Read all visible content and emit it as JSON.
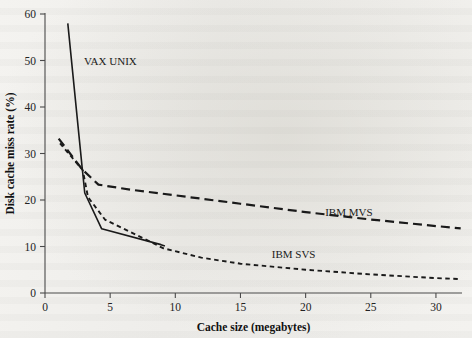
{
  "figure": {
    "background_color": "#f2f1ee",
    "ink_color": "#1a1a1a"
  },
  "chart_data": {
    "type": "line",
    "title": "",
    "subtitle": "",
    "xlabel": "Cache size (megabytes)",
    "ylabel": "Disk cache miss rate (%)",
    "xlim": [
      0,
      32
    ],
    "ylim": [
      0,
      60
    ],
    "xticks": [
      0,
      5,
      10,
      15,
      20,
      25,
      30
    ],
    "xtick_labels": [
      "0",
      "5",
      "10",
      "15",
      "20",
      "25",
      "30"
    ],
    "yticks": [
      0,
      10,
      20,
      30,
      40,
      50,
      60
    ],
    "ytick_labels": [
      "0",
      "10",
      "20",
      "30",
      "40",
      "50",
      "60"
    ],
    "grid": false,
    "legend_position": "inline-annotations",
    "series": [
      {
        "name": "VAX UNIX",
        "style": "solid",
        "label_x": 3.0,
        "label_y": 49.0,
        "points": [
          {
            "x": 1.75,
            "y": 58.0
          },
          {
            "x": 2.85,
            "y": 27.0
          },
          {
            "x": 3.05,
            "y": 21.5
          },
          {
            "x": 4.35,
            "y": 13.8
          },
          {
            "x": 8.9,
            "y": 10.4
          },
          {
            "x": 9.2,
            "y": 10.1
          }
        ]
      },
      {
        "name": "IBM MVS",
        "style": "long-dash",
        "label_x": 21.5,
        "label_y": 16.6,
        "points": [
          {
            "x": 1.05,
            "y": 33.2
          },
          {
            "x": 2.85,
            "y": 26.6
          },
          {
            "x": 4.1,
            "y": 23.3
          },
          {
            "x": 6.6,
            "y": 22.2
          },
          {
            "x": 10.0,
            "y": 21.0
          },
          {
            "x": 15.0,
            "y": 19.2
          },
          {
            "x": 20.0,
            "y": 17.4
          },
          {
            "x": 25.0,
            "y": 15.8
          },
          {
            "x": 30.0,
            "y": 14.4
          },
          {
            "x": 31.9,
            "y": 13.9
          }
        ]
      },
      {
        "name": "IBM SVS",
        "style": "short-dash",
        "label_x": 17.4,
        "label_y": 7.5,
        "points": [
          {
            "x": 1.15,
            "y": 32.2
          },
          {
            "x": 2.9,
            "y": 26.4
          },
          {
            "x": 3.3,
            "y": 20.6
          },
          {
            "x": 4.6,
            "y": 15.8
          },
          {
            "x": 9.1,
            "y": 9.6
          },
          {
            "x": 12.0,
            "y": 7.6
          },
          {
            "x": 15.0,
            "y": 6.3
          },
          {
            "x": 20.0,
            "y": 5.0
          },
          {
            "x": 25.0,
            "y": 4.0
          },
          {
            "x": 30.0,
            "y": 3.2
          },
          {
            "x": 31.9,
            "y": 3.0
          }
        ]
      }
    ]
  }
}
